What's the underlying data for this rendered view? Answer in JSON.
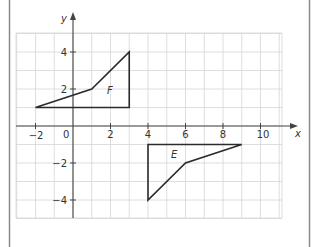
{
  "diagram": {
    "type": "coordinate-plane",
    "axes": {
      "x_label": "x",
      "y_label": "y",
      "origin_label": "0",
      "x_ticks": [
        {
          "value": -2,
          "label": "−2"
        },
        {
          "value": 2,
          "label": "2"
        },
        {
          "value": 4,
          "label": "4"
        },
        {
          "value": 6,
          "label": "6"
        },
        {
          "value": 8,
          "label": "8"
        },
        {
          "value": 10,
          "label": "10"
        }
      ],
      "y_ticks": [
        {
          "value": 4,
          "label": "4"
        },
        {
          "value": 2,
          "label": "2"
        },
        {
          "value": -2,
          "label": "−2"
        },
        {
          "value": -4,
          "label": "−4"
        }
      ],
      "x_range": [
        -3,
        11
      ],
      "y_range": [
        -5,
        5
      ],
      "grid": true,
      "grid_step": 1
    },
    "shapes": [
      {
        "label": "F",
        "vertices": [
          [
            -2,
            1
          ],
          [
            1,
            2
          ],
          [
            3,
            4
          ],
          [
            3,
            1
          ]
        ],
        "label_pos": [
          2,
          1.75
        ]
      },
      {
        "label": "E",
        "vertices": [
          [
            4,
            -1
          ],
          [
            9,
            -1
          ],
          [
            6,
            -2
          ],
          [
            4,
            -4
          ]
        ],
        "label_pos": [
          5,
          -1.55
        ]
      }
    ],
    "colors": {
      "grid": "#d6d6d6",
      "axis": "#444444",
      "shape_stroke": "#2b2b2b",
      "border": "#8a8a8a"
    }
  }
}
